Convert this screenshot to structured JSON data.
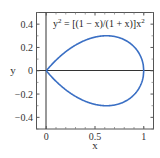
{
  "chart_data": {
    "type": "line",
    "title": "",
    "annotation": "y² = [(1 − x)/(1 + x)]x²",
    "annotation_parts": {
      "lhs": "y",
      "lhs_sup": "2",
      "rhs": " = [(1 − x)/(1 + x)]x",
      "rhs_sup": "2"
    },
    "xlabel": "x",
    "ylabel": "y",
    "xlim": [
      -0.1,
      1.1
    ],
    "ylim": [
      -0.5,
      0.5
    ],
    "xticks": [
      0,
      0.5,
      1
    ],
    "xtick_labels": [
      "0",
      "0.5",
      "1"
    ],
    "yticks": [
      0.4,
      0.2,
      0,
      -0.2,
      -0.4
    ],
    "ytick_labels": [
      "0.4",
      "0.2",
      "0",
      "−0.2",
      "−0.4"
    ],
    "grid": false,
    "legend": null,
    "series": [
      {
        "name": "upper branch",
        "formula": "y = x*sqrt((1-x)/(1+x))",
        "x": [
          0,
          0.1,
          0.2,
          0.3,
          0.4,
          0.5,
          0.6,
          0.618,
          0.7,
          0.8,
          0.9,
          0.95,
          1.0
        ],
        "y": [
          0,
          0.09,
          0.163,
          0.22,
          0.262,
          0.289,
          0.3,
          0.3,
          0.294,
          0.267,
          0.206,
          0.151,
          0
        ]
      },
      {
        "name": "lower branch",
        "formula": "y = -x*sqrt((1-x)/(1+x))",
        "x": [
          0,
          0.1,
          0.2,
          0.3,
          0.4,
          0.5,
          0.6,
          0.618,
          0.7,
          0.8,
          0.9,
          0.95,
          1.0
        ],
        "y": [
          0,
          -0.09,
          -0.163,
          -0.22,
          -0.262,
          -0.289,
          -0.3,
          -0.3,
          -0.294,
          -0.267,
          -0.206,
          -0.151,
          0
        ]
      }
    ],
    "colors": {
      "curve": "#3a6fc4",
      "axes": "#333333",
      "frame": "#555555"
    }
  }
}
